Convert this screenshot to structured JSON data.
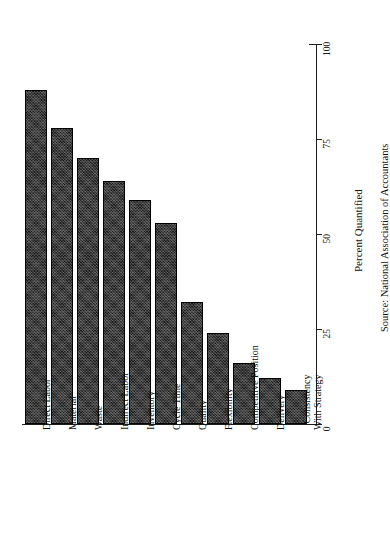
{
  "chart_data": {
    "type": "bar",
    "title": "",
    "subtitle": "",
    "xlabel": "",
    "ylabel": "Percent Quantified",
    "orientation": "vertical-bars-rotated-page",
    "grid": false,
    "legend": null,
    "ylim": [
      0,
      100
    ],
    "ticks": [
      0,
      25,
      50,
      75,
      100
    ],
    "tick_labels": [
      "0",
      "25",
      "50",
      "75",
      "100"
    ],
    "categories": [
      "Direct Labor",
      "Material",
      "Waste",
      "Indirect Labor",
      "Inventory",
      "Cycle Time",
      "Quality",
      "Flexibility",
      "Competitive Position",
      "Delivery",
      "Consistency With Strategy"
    ],
    "category_label_lines": [
      [
        "Direct Labor"
      ],
      [
        "Material"
      ],
      [
        "Waste"
      ],
      [
        "Indirect Labor"
      ],
      [
        "Inventory"
      ],
      [
        "Cycle Time"
      ],
      [
        "Quality"
      ],
      [
        "Flexibility"
      ],
      [
        "Competitive Position"
      ],
      [
        "Delivery"
      ],
      [
        "Consistency",
        "With Strategy"
      ]
    ],
    "values": [
      88,
      78,
      70,
      64,
      59,
      53,
      32,
      24,
      16,
      12,
      9
    ],
    "bar_color": "#1c1c1c"
  },
  "annotations": {
    "source": "Source:  National Association of Accountants"
  },
  "axis_title": "Percent Quantified"
}
